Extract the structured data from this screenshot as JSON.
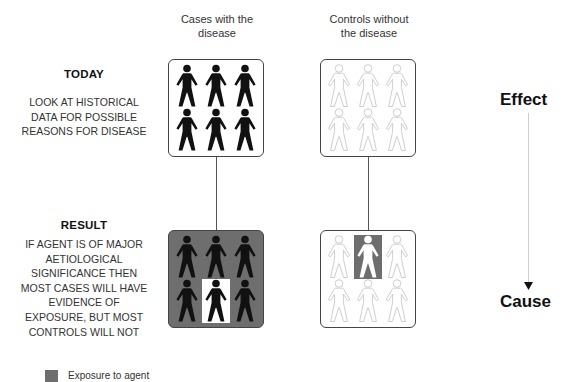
{
  "columns": {
    "cases": {
      "title_line1": "Cases with the",
      "title_line2": "disease"
    },
    "controls": {
      "title_line1": "Controls without",
      "title_line2": "the disease"
    }
  },
  "today": {
    "heading": "TODAY",
    "lines": [
      "LOOK AT HISTORICAL",
      "DATA FOR POSSIBLE",
      "REASONS FOR DISEASE"
    ]
  },
  "result": {
    "heading": "RESULT",
    "lines": [
      "IF AGENT IS OF MAJOR",
      "AETIOLOGICAL",
      "SIGNIFICANCE THEN",
      "MOST CASES WILL HAVE",
      "EVIDENCE OF",
      "EXPOSURE, BUT MOST",
      "CONTROLS WILL NOT"
    ]
  },
  "axis": {
    "top_label": "Effect",
    "bottom_label": "Cause",
    "direction": "down-arrow"
  },
  "legend": {
    "label": "Exposure to agent",
    "swatch_color": "#6e6e6e"
  },
  "groups": {
    "cases_today": {
      "figures": 6,
      "figure_style": "solid-black",
      "exposed_cells": []
    },
    "controls_today": {
      "figures": 6,
      "figure_style": "outline-light",
      "exposed_cells": []
    },
    "cases_result": {
      "figures": 6,
      "figure_style": "solid-black",
      "background": "exposed",
      "unexposed_cells": [
        4
      ]
    },
    "controls_result": {
      "figures": 6,
      "figure_style": "outline-light",
      "exposed_cells": [
        1
      ]
    }
  },
  "colors": {
    "exposure_grey": "#6e6e6e",
    "figure_black": "#111111",
    "figure_outline": "#c8c8c8"
  }
}
